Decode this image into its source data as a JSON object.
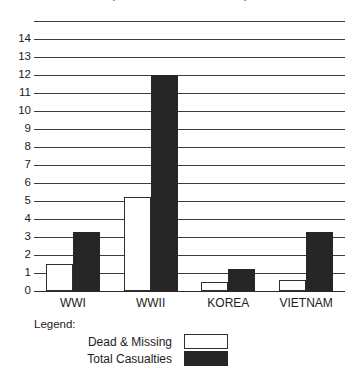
{
  "chart_data": {
    "type": "bar",
    "title": "(in hundreds of thousands)",
    "xlabel": "",
    "ylabel": "",
    "ylim": [
      0,
      15
    ],
    "ytick_step": 1,
    "ytick_labels": [
      "14",
      "13",
      "12",
      "11",
      "10",
      "9",
      "8",
      "7",
      "6",
      "5",
      "4",
      "3",
      "2",
      "1",
      "0"
    ],
    "grid": true,
    "legend_position": "bottom-left",
    "categories": [
      "WWI",
      "WWII",
      "KOREA",
      "VIETNAM"
    ],
    "series": [
      {
        "name": "Dead & Missing",
        "color": "#ffffff",
        "values": [
          1.5,
          5.2,
          0.5,
          0.6
        ]
      },
      {
        "name": "Total Casualties",
        "color": "#262626",
        "values": [
          3.3,
          12.0,
          1.2,
          3.3
        ]
      }
    ]
  },
  "legend": {
    "heading": "Legend:",
    "entries": [
      {
        "label": "Dead & Missing",
        "swatch": "light"
      },
      {
        "label": "Total Casualties",
        "swatch": "dark"
      }
    ]
  }
}
